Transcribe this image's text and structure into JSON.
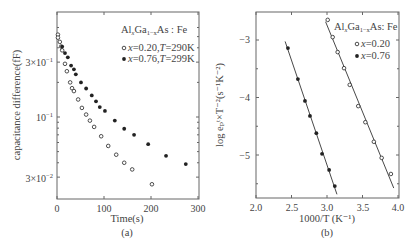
{
  "chart_data": [
    {
      "panel": "(a)",
      "type": "scatter",
      "title": "",
      "xlabel": "Time(s)",
      "ylabel": "capacitance difference(fF)",
      "yscale": "log",
      "xlim": [
        0,
        300
      ],
      "ylim": [
        0.0215,
        0.67
      ],
      "xticks": [
        0,
        100,
        200,
        300
      ],
      "xtick_labels": [
        "0",
        "100",
        "200",
        "300"
      ],
      "yticks": [
        0.3,
        0.1,
        0.03
      ],
      "ytick_labels": [
        "3×10⁻¹",
        "10⁻¹",
        "3×10⁻²"
      ],
      "grid": false,
      "legend": {
        "title": "AlxGa1−xAs: Fe",
        "position": "upper right",
        "entries": [
          "x=0.20, T=290K",
          "x=0.76, T=299K"
        ]
      },
      "series": [
        {
          "name": "x=0.20, T=290K",
          "marker": "open-circle",
          "x": [
            2,
            2,
            6,
            9,
            11,
            17,
            21,
            28,
            32,
            36,
            45,
            53,
            62,
            70,
            79,
            94,
            109,
            126,
            143,
            160,
            202
          ],
          "y": [
            0.52,
            0.49,
            0.45,
            0.41,
            0.38,
            0.29,
            0.25,
            0.2,
            0.178,
            0.168,
            0.142,
            0.12,
            0.105,
            0.093,
            0.082,
            0.068,
            0.056,
            0.047,
            0.04,
            0.035,
            0.026
          ]
        },
        {
          "name": "x=0.76, T=299K",
          "marker": "filled-circle",
          "x": [
            11,
            17,
            23,
            30,
            36,
            40,
            51,
            62,
            74,
            83,
            91,
            102,
            123,
            143,
            164,
            194,
            232,
            274
          ],
          "y": [
            0.41,
            0.36,
            0.33,
            0.28,
            0.26,
            0.235,
            0.2,
            0.177,
            0.154,
            0.137,
            0.122,
            0.113,
            0.093,
            0.079,
            0.07,
            0.058,
            0.046,
            0.039
          ]
        }
      ]
    },
    {
      "panel": "(b)",
      "type": "scatter",
      "title": "",
      "xlabel": "1000/T (K⁻¹)",
      "ylabel": "log eₚᵗ×T⁻²(s⁻¹K⁻²)",
      "xlim": [
        2.0,
        4.0
      ],
      "ylim": [
        -5.75,
        -2.5
      ],
      "xticks": [
        2.0,
        2.5,
        3.0,
        3.5,
        4.0
      ],
      "xtick_labels": [
        "2.0",
        "2.5",
        "3.0",
        "3.5",
        "4.0"
      ],
      "yticks": [
        -3,
        -4,
        -5
      ],
      "ytick_labels": [
        "−3",
        "−4",
        "−5"
      ],
      "grid": false,
      "legend": {
        "title": "AlxGa1−xAs: Fe",
        "position": "upper right",
        "entries": [
          "x=0.20",
          "x=0.76"
        ]
      },
      "series": [
        {
          "name": "x=0.20",
          "marker": "open-circle",
          "fit_line": true,
          "x": [
            3.01,
            3.08,
            3.15,
            3.24,
            3.32,
            3.44,
            3.54,
            3.66,
            3.77,
            3.9
          ],
          "y": [
            -2.65,
            -2.95,
            -3.21,
            -3.49,
            -3.78,
            -4.15,
            -4.43,
            -4.77,
            -5.05,
            -5.33
          ]
        },
        {
          "name": "x=0.76",
          "marker": "filled-circle",
          "fit_line": true,
          "x": [
            2.45,
            2.59,
            2.69,
            2.76,
            2.85,
            2.93,
            3.03,
            3.11
          ],
          "y": [
            -3.14,
            -3.68,
            -4.06,
            -4.32,
            -4.62,
            -4.98,
            -5.26,
            -5.54
          ]
        }
      ]
    }
  ],
  "panels": {
    "a": {
      "caption": "(a)",
      "xlabel": "Time(s)",
      "ylabel": "capacitance difference(fF)",
      "legend_title_main": "Al",
      "legend_title_sub1": "x",
      "legend_title_mid": "Ga",
      "legend_title_sub2": "1−x",
      "legend_title_end": "As : Fe",
      "legend_entries": [
        {
          "prefix": "x",
          "text": "=0.20,",
          "t": "T",
          "tval": "=290K"
        },
        {
          "prefix": "x",
          "text": "=0.76,",
          "t": "T",
          "tval": "=299K"
        }
      ],
      "xtick_labels": [
        "0",
        "100",
        "200",
        "300"
      ],
      "ytick_labels": [
        "3×10",
        "10",
        "3×10"
      ],
      "ytick_exps": [
        "−1",
        "−1",
        "−2"
      ]
    },
    "b": {
      "caption": "(b)",
      "xlabel": "1000/T (K⁻¹)",
      "ylabel": "log eₚᵗ×T⁻²(s⁻¹K⁻²)",
      "legend_title_main": "Al",
      "legend_title_sub1": "x",
      "legend_title_mid": "Ga",
      "legend_title_sub2": "1−x",
      "legend_title_end": "As: Fe",
      "legend_entries": [
        {
          "prefix": "x",
          "text": "=0.20"
        },
        {
          "prefix": "x",
          "text": "=0.76"
        }
      ],
      "xtick_labels": [
        "2.0",
        "2.5",
        "3.0",
        "3.5",
        "4.0"
      ],
      "ytick_labels": [
        "−3",
        "−4",
        "−5"
      ]
    }
  },
  "colors": {
    "axis": "#666666",
    "text": "#444444",
    "marker": "#222222",
    "background": "#ffffff"
  }
}
